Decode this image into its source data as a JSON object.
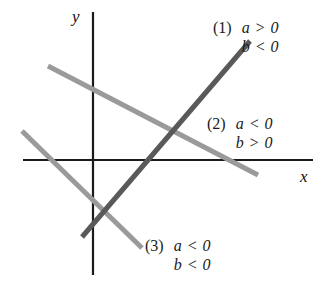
{
  "figure": {
    "background_color": "#ffffff",
    "axes": {
      "x_label": "x",
      "y_label": "y",
      "color": "#1a1a1a",
      "origin": [
        93,
        160
      ],
      "x_extent": [
        23,
        313
      ],
      "y_extent": [
        12,
        275
      ]
    },
    "line_colors": {
      "dark": "#595959",
      "light": "#9a9a9a"
    }
  },
  "chart_data": {
    "type": "line",
    "title": "",
    "xlabel": "x",
    "ylabel": "y",
    "grid": false,
    "legend": "none",
    "axis_origin_px": [
      93,
      160
    ],
    "xlim": [
      23,
      313
    ],
    "ylim": [
      275,
      12
    ],
    "series": [
      {
        "name": "(1)",
        "label": "(1)",
        "slope_sign": "positive",
        "intercept_sign": "negative",
        "conditions": [
          "a > 0",
          "b < 0"
        ],
        "color": "#595959",
        "width": 5,
        "points_px": [
          [
            82,
            237
          ],
          [
            250,
            41
          ]
        ]
      },
      {
        "name": "(2)",
        "label": "(2)",
        "slope_sign": "negative",
        "intercept_sign": "positive",
        "conditions": [
          "a < 0",
          "b > 0"
        ],
        "color": "#9a9a9a",
        "width": 5,
        "points_px": [
          [
            48,
            66
          ],
          [
            258,
            175
          ]
        ]
      },
      {
        "name": "(3)",
        "label": "(3)",
        "slope_sign": "negative",
        "intercept_sign": "negative",
        "conditions": [
          "a < 0",
          "b < 0"
        ],
        "color": "#9a9a9a",
        "width": 5,
        "points_px": [
          [
            22,
            131
          ],
          [
            142,
            248
          ]
        ]
      }
    ]
  },
  "annotations": [
    {
      "index": "(1)",
      "line1": "a > 0",
      "line2": "b < 0"
    },
    {
      "index": "(2)",
      "line1": "a < 0",
      "line2": "b > 0"
    },
    {
      "index": "(3)",
      "line1": "a < 0",
      "line2": "b < 0"
    }
  ]
}
